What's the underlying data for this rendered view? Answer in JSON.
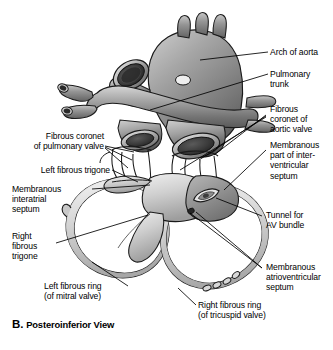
{
  "figure": {
    "caption_letter": "B.",
    "caption_text": "Posteroinferior View",
    "view": "Posteroinferior View"
  },
  "labels": {
    "arch_of_aorta": "Arch of aorta",
    "pulmonary_trunk": "Pulmonary\ntrunk",
    "fibrous_coronet_aortic": "Fibrous\ncoronet of\naortic valve",
    "membranous_interventricular": "Membranous\npart of inter-\nventricular\nseptum",
    "tunnel_av_bundle": "Tunnel for\nAV bundle",
    "membranous_atrioventricular": "Membranous\natrioventricular\nseptum",
    "right_fibrous_ring": "Right fibrous ring\n(of tricuspid valve)",
    "left_fibrous_ring": "Left fibrous ring\n(of mitral valve)",
    "right_fibrous_trigone": "Right\nfibrous\ntrigone",
    "membranous_interatrial": "Membranous\ninteratrial\nseptum",
    "left_fibrous_trigone": "Left fibrous trigone",
    "fibrous_coronet_pulmonary": "Fibrous coronet\nof pulmonary valve"
  },
  "colors": {
    "ink": "#000000",
    "background": "#ffffff",
    "vessel_mid": "#9a9a9a",
    "vessel_dark": "#4a4a4a",
    "vessel_light": "#d2d2d2",
    "lumen": "#2e2e2e",
    "fibrous_light": "#dcdcdc",
    "fibrous_shade": "#a8a8a8",
    "septum_gray": "#8d8d8d",
    "outline": "#1a1a1a"
  }
}
